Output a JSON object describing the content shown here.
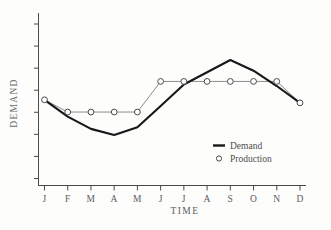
{
  "chart_data": {
    "type": "line",
    "title": "",
    "xlabel": "TIME",
    "ylabel": "DEMAND",
    "grid": false,
    "legend_position": "lower-right",
    "categories": [
      "J",
      "F",
      "M",
      "A",
      "M",
      "J",
      "J",
      "A",
      "S",
      "O",
      "N",
      "D"
    ],
    "x_tick_labels": [
      "J",
      "F",
      "M",
      "A",
      "M",
      "J",
      "J",
      "A",
      "S",
      "O",
      "N",
      "D"
    ],
    "y_tick_labels": [],
    "y_axis_has_numeric_labels": false,
    "y_tick_count": 8,
    "ylim": [
      0,
      100
    ],
    "xlim": [
      0,
      11
    ],
    "series": [
      {
        "name": "Demand",
        "style": "solid-thick",
        "marker": "none",
        "color": "#171717",
        "values": [
          52,
          41,
          33,
          29,
          34,
          48,
          62,
          70,
          78,
          71,
          61,
          50
        ]
      },
      {
        "name": "Production",
        "style": "solid-thin",
        "marker": "open-circle",
        "color": "#8d8d8d",
        "values": [
          52,
          44,
          44,
          44,
          44,
          64,
          64,
          64,
          64,
          64,
          64,
          50
        ]
      }
    ],
    "legend": [
      {
        "label": "Demand",
        "symbol": "line"
      },
      {
        "label": "Production",
        "symbol": "circle"
      }
    ]
  }
}
